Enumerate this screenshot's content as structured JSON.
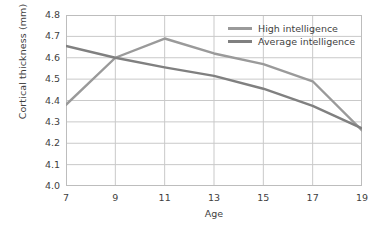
{
  "chart_data": {
    "type": "line",
    "title": "",
    "xlabel": "Age",
    "ylabel": "Cortical thickness (mm)",
    "x": [
      7,
      9,
      11,
      13,
      15,
      17,
      19
    ],
    "xtick_labels": [
      "7",
      "9",
      "11",
      "13",
      "15",
      "17",
      "19"
    ],
    "ytick_labels": [
      "4.0",
      "4.1",
      "4.2",
      "4.3",
      "4.4",
      "4.5",
      "4.6",
      "4.7",
      "4.8"
    ],
    "ytick_values": [
      4.0,
      4.1,
      4.2,
      4.3,
      4.4,
      4.5,
      4.6,
      4.7,
      4.8
    ],
    "xlim": [
      7,
      19
    ],
    "ylim": [
      4.0,
      4.8
    ],
    "grid": true,
    "legend_position": "top-right-inside",
    "series": [
      {
        "name": "High intelligence",
        "color": "#9a9a9a",
        "values": [
          4.38,
          4.6,
          4.69,
          4.62,
          4.57,
          4.49,
          4.26
        ]
      },
      {
        "name": "Average intelligence",
        "color": "#808080",
        "values": [
          4.655,
          4.6,
          4.555,
          4.515,
          4.455,
          4.375,
          4.27
        ]
      }
    ]
  },
  "colors": {
    "grid": "#c9c9c9",
    "frame": "#bdbdbd",
    "text": "#3f3f3f",
    "background": "#ffffff"
  }
}
